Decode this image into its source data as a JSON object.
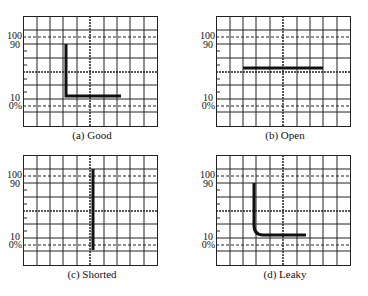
{
  "figure": {
    "panels": [
      {
        "id": "a",
        "caption": "(a) Good",
        "trace": "L-shape: sharp rise to 90, quick settle along 10% baseline"
      },
      {
        "id": "b",
        "caption": "(b) Open",
        "trace": "horizontal line at center"
      },
      {
        "id": "c",
        "caption": "(c) Shorted",
        "trace": "vertical line at center, 0% to 100%"
      },
      {
        "id": "d",
        "caption": "(d) Leaky",
        "trace": "L-shape with rounded corner, baseline above 10%"
      }
    ],
    "axis_labels": {
      "l100": "100",
      "l90": "90",
      "l10": "10",
      "l0": "0%"
    },
    "grid": {
      "columns": 10,
      "rows": 8
    },
    "colors": {
      "grid": "#222222",
      "trace": "#111111",
      "background": "#ffffff"
    }
  }
}
